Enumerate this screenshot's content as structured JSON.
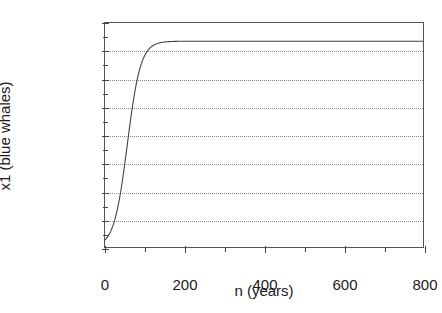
{
  "chart_data": {
    "type": "line",
    "title": "",
    "xlabel": "n (years)",
    "ylabel": "x1 (blue whales)",
    "xlim": [
      0,
      800
    ],
    "ylim": [
      0,
      160000
    ],
    "grid": "horizontal-dotted",
    "legend": "none",
    "x_ticks": [
      0,
      200,
      400,
      600,
      800
    ],
    "x_tick_labels": [
      "0",
      "200",
      "400",
      "600",
      "800"
    ],
    "x_minor_ticks": [
      100,
      300,
      500,
      700
    ],
    "y_ticks": [
      0,
      20000,
      40000,
      60000,
      80000,
      100000,
      120000,
      140000,
      160000
    ],
    "y_tick_labels": [
      "0",
      "20000",
      "40000",
      "60000",
      "80000",
      "100000",
      "120000",
      "140000",
      "160000"
    ],
    "y_minor_ticks": [
      10000,
      30000,
      50000,
      70000,
      90000,
      110000,
      130000,
      150000
    ],
    "series": [
      {
        "name": "x1 (blue whales)",
        "color": "#444444",
        "carrying_capacity": 147000,
        "initial_value": 5000,
        "x": [
          0,
          10,
          20,
          30,
          40,
          50,
          60,
          70,
          80,
          90,
          100,
          110,
          120,
          130,
          140,
          150,
          160,
          180,
          200,
          250,
          300,
          400,
          500,
          600,
          700,
          800
        ],
        "values": [
          5000,
          6900,
          9500,
          13000,
          17700,
          23800,
          31600,
          41100,
          52200,
          64400,
          77000,
          89200,
          100300,
          109900,
          117800,
          124100,
          129000,
          135800,
          139800,
          144300,
          145900,
          146800,
          146950,
          146990,
          147000,
          147000
        ]
      }
    ]
  }
}
